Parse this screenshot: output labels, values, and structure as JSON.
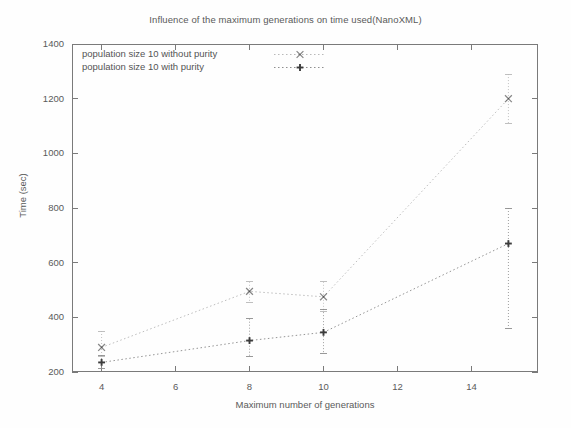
{
  "chart_data": {
    "type": "line",
    "title": "Influence of the maximum generations on time used(NanoXML)",
    "xlabel": "Maximum number of generations",
    "ylabel": "Time (sec)",
    "xlim": [
      3.2,
      15.8
    ],
    "ylim": [
      200,
      1400
    ],
    "xticks": [
      4,
      6,
      8,
      10,
      12,
      14
    ],
    "yticks": [
      200,
      400,
      600,
      800,
      1000,
      1200,
      1400
    ],
    "grid": false,
    "legend_position": "top-left-inside",
    "line_style": "dotted",
    "has_error_bars": true,
    "x": [
      4,
      8,
      10,
      15
    ],
    "series": [
      {
        "name": "population size 10 without purity",
        "marker": "cross-x",
        "values": [
          290,
          495,
          475,
          1200
        ],
        "err_low": [
          255,
          455,
          420,
          1110
        ],
        "err_high": [
          350,
          530,
          530,
          1290
        ]
      },
      {
        "name": "population size 10 with purity",
        "marker": "plus",
        "values": [
          235,
          315,
          345,
          670
        ],
        "err_low": [
          212,
          258,
          268,
          360
        ],
        "err_high": [
          262,
          395,
          430,
          800
        ]
      }
    ]
  },
  "axis": {
    "ytick_labels": [
      "1400",
      "1200",
      "1000",
      "800",
      "600",
      "400",
      "200"
    ],
    "xtick_labels": [
      "4",
      "6",
      "8",
      "10",
      "12",
      "14"
    ]
  },
  "legend": {
    "items": [
      {
        "label": "population size 10 without purity",
        "marker": "cross-x"
      },
      {
        "label": "population size 10 with purity",
        "marker": "plus"
      }
    ]
  },
  "colors": {
    "series_without_purity": "#b9b9b9",
    "series_with_purity": "#8f8f8f",
    "marker": "#3c3c3c",
    "axis": "#7a7a7a",
    "text": "#5a5a5a",
    "background": "#fefefe"
  }
}
